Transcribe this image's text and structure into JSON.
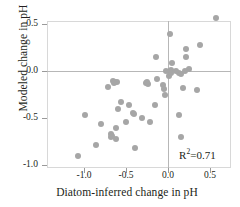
{
  "chart_data": {
    "type": "scatter",
    "title": "",
    "xlabel": "Diatom-inferred change in pH",
    "ylabel": "Modeled change in pH",
    "xlim": [
      -1.18,
      0.68
    ],
    "ylim": [
      -1.09,
      0.62
    ],
    "xticks": [
      -1.0,
      -0.5,
      0.0,
      0.5
    ],
    "xtick_labels": [
      "-1.0",
      "-0.5",
      "0.0",
      "0.5"
    ],
    "yticks": [
      0.5,
      0.0,
      -0.5,
      -1.0
    ],
    "ytick_labels": [
      "0.5",
      "0.0",
      "-0.5",
      "-1.0"
    ],
    "grid": false,
    "legend": null,
    "zero_reference_lines": {
      "horizontal": 0.0,
      "vertical": 0.0
    },
    "annotations": [
      {
        "text": "R2=0.71",
        "display": "R²=0.71",
        "x": 0.18,
        "y": -0.88
      }
    ],
    "r_squared": 0.71,
    "marker": {
      "shape": "circle",
      "color": "#a6a6a6",
      "size": 6
    },
    "point_count": 52,
    "points": [
      {
        "x": 0.57,
        "y": 0.56
      },
      {
        "x": 0.02,
        "y": 0.39
      },
      {
        "x": 0.38,
        "y": 0.28
      },
      {
        "x": 0.22,
        "y": 0.23
      },
      {
        "x": 0.21,
        "y": 0.15
      },
      {
        "x": -0.14,
        "y": 0.15
      },
      {
        "x": 0.05,
        "y": 0.09
      },
      {
        "x": 0.25,
        "y": 0.02
      },
      {
        "x": 0.04,
        "y": 0.01
      },
      {
        "x": 0.02,
        "y": -0.01
      },
      {
        "x": 0.13,
        "y": -0.02
      },
      {
        "x": 0.16,
        "y": -0.03
      },
      {
        "x": 0.01,
        "y": -0.05
      },
      {
        "x": -0.13,
        "y": -0.08
      },
      {
        "x": -0.66,
        "y": -0.11
      },
      {
        "x": -0.63,
        "y": -0.12
      },
      {
        "x": -0.61,
        "y": -0.12
      },
      {
        "x": -0.26,
        "y": -0.13
      },
      {
        "x": -0.24,
        "y": -0.14
      },
      {
        "x": -0.06,
        "y": -0.15
      },
      {
        "x": -0.71,
        "y": -0.17
      },
      {
        "x": 0.18,
        "y": -0.18
      },
      {
        "x": -0.05,
        "y": -0.19
      },
      {
        "x": 0.35,
        "y": -0.2
      },
      {
        "x": -0.04,
        "y": -0.25
      },
      {
        "x": -0.56,
        "y": -0.33
      },
      {
        "x": -0.47,
        "y": -0.36
      },
      {
        "x": -0.16,
        "y": -0.36
      },
      {
        "x": -0.59,
        "y": -0.4
      },
      {
        "x": -0.42,
        "y": -0.45
      },
      {
        "x": -0.4,
        "y": -0.46
      },
      {
        "x": -0.99,
        "y": -0.47
      },
      {
        "x": 0.13,
        "y": -0.47
      },
      {
        "x": -0.31,
        "y": -0.5
      },
      {
        "x": -0.5,
        "y": -0.54
      },
      {
        "x": -0.22,
        "y": -0.54
      },
      {
        "x": -0.8,
        "y": -0.56
      },
      {
        "x": -0.62,
        "y": -0.61
      },
      {
        "x": -0.68,
        "y": -0.67
      },
      {
        "x": -0.68,
        "y": -0.7
      },
      {
        "x": 0.15,
        "y": -0.7
      },
      {
        "x": -0.62,
        "y": -0.72
      },
      {
        "x": -0.86,
        "y": -0.79
      },
      {
        "x": -0.39,
        "y": -0.82
      },
      {
        "x": -1.07,
        "y": -0.9
      },
      {
        "x": 0.03,
        "y": -0.02
      },
      {
        "x": -0.02,
        "y": 0.0
      },
      {
        "x": 0.1,
        "y": 0.0
      },
      {
        "x": 0.2,
        "y": 0.0
      },
      {
        "x": -0.25,
        "y": -0.12
      },
      {
        "x": -0.64,
        "y": -0.13
      },
      {
        "x": -0.67,
        "y": -0.69
      }
    ]
  }
}
